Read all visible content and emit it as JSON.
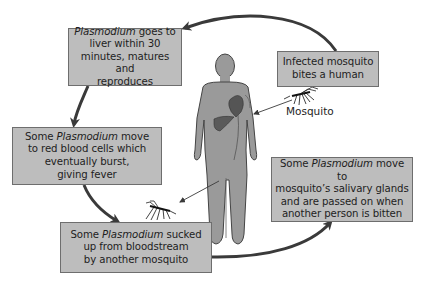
{
  "diagram": {
    "colors": {
      "box_fill": "#bdbdbd",
      "box_border": "#6e6e6e",
      "arrow": "#3a3a3a",
      "body_fill": "#9a9a9a",
      "organ_fill": "#5a5a5a"
    },
    "steps": [
      {
        "id": "liver",
        "italic": "Plasmodium",
        "text_after_italic_line1": " goes to",
        "line2": "liver within 30",
        "line3": "minutes, matures and",
        "line4": "reproduces"
      },
      {
        "id": "bite",
        "line1": "Infected mosquito",
        "line2": "bites a human"
      },
      {
        "id": "red-blood-cells",
        "prefix": "Some ",
        "italic": "Plasmodium",
        "text_after_italic_line1": " move",
        "line2": "to red blood cells which",
        "line3": "eventually burst,",
        "line4": "giving fever"
      },
      {
        "id": "sucked-up",
        "prefix": "Some ",
        "italic": "Plasmodium",
        "text_after_italic_line1": " sucked",
        "line2": "up from bloodstream",
        "line3": "by another mosquito"
      },
      {
        "id": "salivary-glands",
        "prefix": "Some ",
        "italic": "Plasmodium",
        "text_after_italic_line1": " move to",
        "line2": "mosquito’s salivary glands",
        "line3": "and are passed on when",
        "line4": "another person is bitten"
      }
    ],
    "labels": {
      "mosquito": "Mosquito"
    },
    "icons": [
      "human-body-icon",
      "heart-icon",
      "liver-icon",
      "mosquito-icon"
    ]
  }
}
